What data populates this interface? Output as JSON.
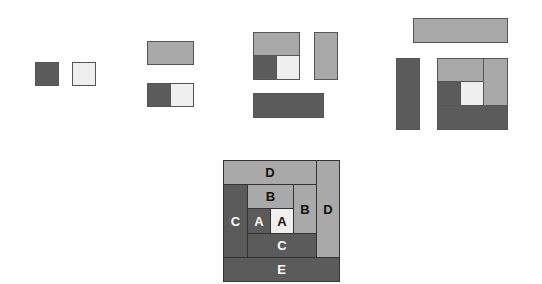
{
  "diagram": {
    "colors": {
      "dark": "#5b5b5b",
      "mid": "#a9a9a9",
      "light": "#efefef",
      "border": "#555555"
    },
    "final_labels": {
      "d_top": "D",
      "d_right": "D",
      "c_left": "C",
      "b_top": "B",
      "b_right": "B",
      "a_dark": "A",
      "a_light": "A",
      "c_bottom": "C",
      "e_bottom": "E"
    }
  }
}
